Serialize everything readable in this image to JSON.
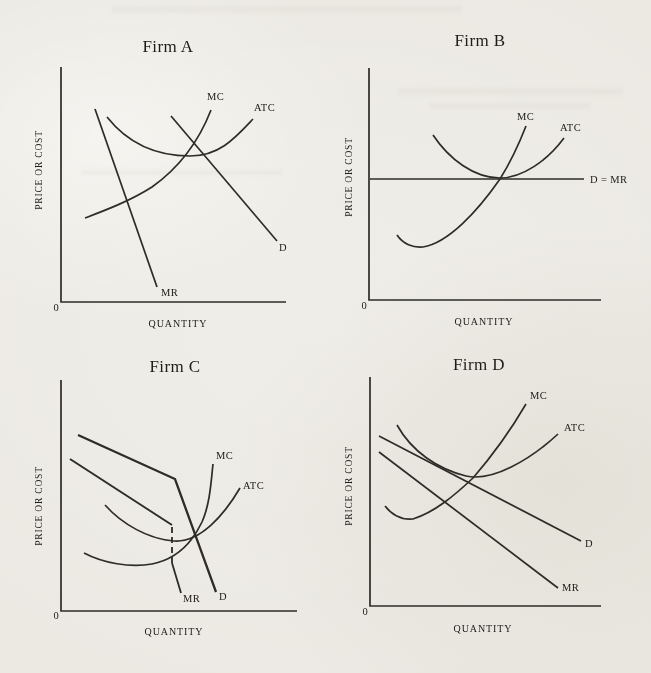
{
  "figure": {
    "paper_color": "#ebe9e2",
    "ink_color": "#2e2c27",
    "panels": [
      {
        "title": "Firm A",
        "y_axis": "PRICE OR COST",
        "x_axis": "QUANTITY",
        "origin": "0",
        "labels": {
          "mc": "MC",
          "atc": "ATC",
          "d": "D",
          "mr": "MR"
        }
      },
      {
        "title": "Firm B",
        "y_axis": "PRICE OR COST",
        "x_axis": "QUANTITY",
        "origin": "0",
        "labels": {
          "mc": "MC",
          "atc": "ATC",
          "d_mr": "D = MR"
        }
      },
      {
        "title": "Firm C",
        "y_axis": "PRICE OR COST",
        "x_axis": "QUANTITY",
        "origin": "0",
        "labels": {
          "mc": "MC",
          "atc": "ATC",
          "d": "D",
          "mr": "MR"
        }
      },
      {
        "title": "Firm D",
        "y_axis": "PRICE OR COST",
        "x_axis": "QUANTITY",
        "origin": "0",
        "labels": {
          "mc": "MC",
          "atc": "ATC",
          "d": "D",
          "mr": "MR"
        }
      }
    ]
  }
}
